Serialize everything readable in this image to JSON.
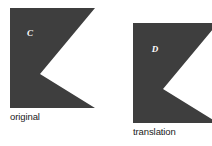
{
  "figure": {
    "type": "geometry-diagram",
    "topic": "translation",
    "background_color": "#ffffff",
    "shape_fill_color": "#3e3e3e",
    "label_color": "#ffffff",
    "caption_color": "#1a1a1a",
    "shapes": [
      {
        "id": "original",
        "letter_label": "C",
        "caption": "original",
        "fill": "#3e3e3e",
        "label_x": 30,
        "label_y": 36,
        "points": "10,8 95,8 40,74 95,108 10,108",
        "clipped": false
      },
      {
        "id": "translation",
        "letter_label": "D",
        "caption": "translation",
        "fill": "#3e3e3e",
        "label_x": 155,
        "label_y": 52,
        "points": "133,23 218,23 163,89 218,123 133,123",
        "clipped": true
      }
    ],
    "captions": {
      "original": "original",
      "translation": "translation"
    }
  }
}
